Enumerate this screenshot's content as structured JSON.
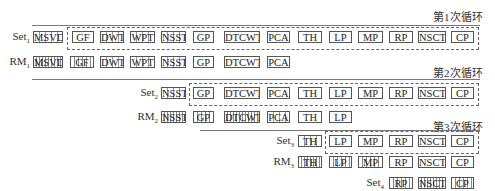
{
  "loops": [
    {
      "label": "第1次循环"
    },
    {
      "label": "第2次循环"
    },
    {
      "label": "第3次循环"
    }
  ],
  "rows": [
    {
      "label": "Set",
      "sub": "1",
      "items": [
        "MSVD",
        "GF",
        "DWT",
        "WPT",
        "NSST",
        "GP",
        "DTCWT",
        "PCA",
        "TH",
        "LP",
        "MP",
        "RP",
        "NSCT",
        "CP"
      ]
    },
    {
      "label": "RM",
      "sub": "1",
      "items": [
        "MSVD",
        "GF",
        "DWT",
        "WPT",
        "NSST",
        "GP",
        "DTCWT",
        "PCA"
      ]
    },
    {
      "label": "Set",
      "sub": "2",
      "items": [
        "NSST",
        "GP",
        "DTCWT",
        "PCA",
        "TH",
        "LP",
        "MP",
        "RP",
        "NSCT",
        "CP"
      ]
    },
    {
      "label": "RM",
      "sub": "2",
      "items": [
        "NSST",
        "GP",
        "DTCWT",
        "PCA",
        "TH",
        "LP"
      ]
    },
    {
      "label": "Set",
      "sub": "3",
      "items": [
        "TH",
        "LP",
        "MP",
        "RP",
        "NSCT",
        "CP"
      ]
    },
    {
      "label": "RM",
      "sub": "3",
      "items": [
        "TH",
        "LP",
        "MP",
        "RP",
        "NSCT",
        "CP"
      ]
    },
    {
      "label": "Set",
      "sub": "4",
      "items": [
        "RP",
        "NSCT",
        "CP"
      ]
    }
  ]
}
